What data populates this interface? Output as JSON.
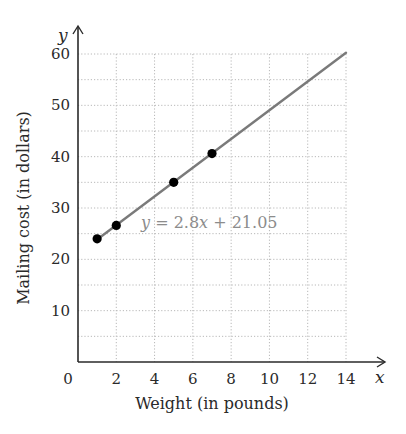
{
  "chart_data": {
    "type": "scatter",
    "title": "",
    "xlabel": "Weight (in pounds)",
    "ylabel": "Mailing cost (in dollars)",
    "x_axis_var": "x",
    "y_axis_var": "y",
    "xlim": [
      0,
      14
    ],
    "ylim": [
      0,
      60
    ],
    "x_ticks": [
      0,
      2,
      4,
      6,
      8,
      10,
      12,
      14
    ],
    "y_ticks": [
      10,
      20,
      30,
      40,
      50,
      60
    ],
    "grid": true,
    "grid_x_step": 2,
    "grid_y_step": 5,
    "series": [
      {
        "name": "data points",
        "type": "scatter",
        "points": [
          {
            "x": 1,
            "y": 24
          },
          {
            "x": 2,
            "y": 26.6
          },
          {
            "x": 5,
            "y": 35
          },
          {
            "x": 7,
            "y": 40.6
          }
        ],
        "color": "#000000"
      },
      {
        "name": "regression line",
        "type": "line",
        "equation": "y = 2.8x + 21.05",
        "slope": 2.8,
        "intercept": 21.05,
        "x_range": [
          1,
          14
        ],
        "color": "#7a7a7a"
      }
    ],
    "annotations": [
      {
        "text": "y = 2.8x + 21.05",
        "x": 3.2,
        "y": 26
      }
    ]
  },
  "labels": {
    "equation_y": "y",
    "equation_rest": " = 2.8",
    "equation_x": "x",
    "equation_tail": " + 21.05"
  }
}
